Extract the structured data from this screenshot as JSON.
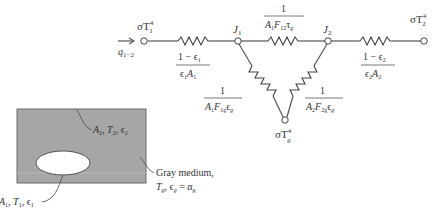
{
  "network": {
    "input_flux": {
      "symbol": "q",
      "sub": "1−2",
      "arrow": "→"
    },
    "nodes": {
      "Eb1": {
        "label": "σT",
        "sub": "1",
        "sup": "4"
      },
      "J1": {
        "label": "J",
        "sub": "1"
      },
      "J2": {
        "label": "J",
        "sub": "2"
      },
      "Eb2": {
        "label": "σT",
        "sub": "2",
        "sup": "4"
      },
      "Ebg": {
        "label": "σT",
        "sub": "g",
        "sup": "4"
      }
    },
    "resistances": {
      "surface1": {
        "numerator": "1 − ϵ",
        "num_sub": "1",
        "denominator": "ϵ",
        "den_sub1": "1",
        "den_mid": "A",
        "den_sub2": "1"
      },
      "surface2": {
        "numerator": "1 − ϵ",
        "num_sub": "2",
        "denominator": "ϵ",
        "den_sub1": "2",
        "den_mid": "A",
        "den_sub2": "2"
      },
      "space12": {
        "numerator": "1",
        "den_a": "A",
        "den_a_sub": "1",
        "den_f": "F",
        "den_f_sub": "12",
        "den_t": "τ",
        "den_t_sub": "g"
      },
      "gas1": {
        "numerator": "1",
        "den_a": "A",
        "den_a_sub": "1",
        "den_f": "F",
        "den_f_sub": "1g",
        "den_e": "ϵ",
        "den_e_sub": "g"
      },
      "gas2": {
        "numerator": "1",
        "den_a": "A",
        "den_a_sub": "2",
        "den_f": "F",
        "den_f_sub": "2g",
        "den_e": "ϵ",
        "den_e_sub": "g"
      }
    }
  },
  "enclosure": {
    "fill_color": "#a6a6a6",
    "outer_label": {
      "a": "A",
      "a_sub": "2",
      "t": "T",
      "t_sub": "2",
      "e": "ϵ",
      "e_sub": "2"
    },
    "inner_label": {
      "a": "A",
      "a_sub": "1",
      "t": "T",
      "t_sub": "1",
      "e": "ϵ",
      "e_sub": "1"
    },
    "medium_label": {
      "line1": "Gray medium,",
      "t": "T",
      "t_sub": "g",
      "e": "ϵ",
      "e_sub": "g",
      "eq": " = ",
      "alpha": "α",
      "alpha_sub": "g"
    }
  }
}
